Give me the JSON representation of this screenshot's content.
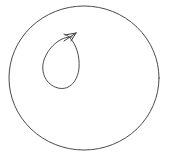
{
  "figure": {
    "background_color": "#ffffff",
    "width": 169,
    "height": 159,
    "stroke_color": "#4a4a4a",
    "arrow_color": "#3a3a3a"
  },
  "chart_data": {
    "type": "diagram",
    "grid": false,
    "legend": null,
    "xlabel": "",
    "ylabel": "",
    "shapes": [
      {
        "name": "outer-boundary-circle",
        "kind": "ellipse",
        "center_x": 84,
        "center_y": 78,
        "radius_x": 75,
        "radius_y": 72,
        "stroke": "#4a4a4a",
        "stroke_width": 1,
        "fill": "none"
      },
      {
        "name": "inner-loop-teardrop",
        "kind": "closed-path",
        "bbox": [
          42,
          34,
          80,
          89
        ],
        "stroke": "#4a4a4a",
        "stroke_width": 1,
        "fill": "none",
        "path": "M 72 37 C 60 36 48 48 44 60 C 40 72 46 85 58 88 C 70 91 78 80 79 68 C 80 56 76 44 70 38 C 67 35 65 34 64 34"
      },
      {
        "name": "orientation-arrowhead",
        "kind": "arrowhead",
        "tip_x": 76,
        "tip_y": 33,
        "direction": "up-right",
        "stroke": "#3a3a3a",
        "stroke_width": 1,
        "path": "M 64 41 L 76 33 M 76 33 L 65 35 M 76 33 L 71 41"
      }
    ],
    "annotations": [],
    "labels": []
  }
}
